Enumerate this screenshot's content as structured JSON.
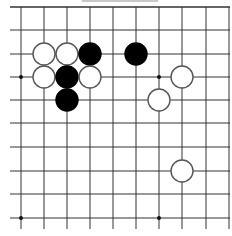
{
  "board": {
    "description": "Go board diagram fragment (top-left region)",
    "columns_x": [
      21,
      44,
      67,
      90,
      113,
      136,
      159,
      182,
      206,
      229
    ],
    "rows_y": [
      7,
      30,
      54,
      77,
      100,
      123,
      147,
      171,
      194,
      218
    ],
    "line_color": "#333333",
    "background": "#ffffff",
    "stone_radius": 11,
    "star_points": [
      {
        "col": 0,
        "row": 3
      },
      {
        "col": 6,
        "row": 3
      },
      {
        "col": 0,
        "row": 9
      },
      {
        "col": 6,
        "row": 9
      }
    ],
    "stones": [
      {
        "color": "white",
        "col": 1,
        "row": 2
      },
      {
        "color": "white",
        "col": 2,
        "row": 2
      },
      {
        "color": "black",
        "col": 3,
        "row": 2
      },
      {
        "color": "black",
        "col": 5,
        "row": 2
      },
      {
        "color": "white",
        "col": 1,
        "row": 3
      },
      {
        "color": "black",
        "col": 2,
        "row": 3
      },
      {
        "color": "white",
        "col": 3,
        "row": 3
      },
      {
        "color": "white",
        "col": 7,
        "row": 3
      },
      {
        "color": "black",
        "col": 2,
        "row": 4
      },
      {
        "color": "white",
        "col": 6,
        "row": 4
      },
      {
        "color": "white",
        "col": 7,
        "row": 7
      }
    ]
  }
}
